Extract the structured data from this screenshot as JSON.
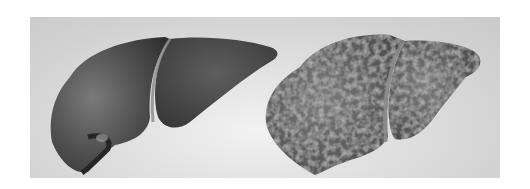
{
  "image": {
    "description": "Grayscale illustration comparing a healthy liver (left, smooth surface) with a cirrhotic liver (right, nodular bumpy surface)",
    "background_color": "#d6d6d6",
    "frame": {
      "x": 30,
      "y": 17,
      "width": 470,
      "height": 161
    },
    "subjects": [
      {
        "name": "healthy-liver",
        "position": "left",
        "surface": "smooth",
        "tone": "#555555"
      },
      {
        "name": "cirrhotic-liver",
        "position": "right",
        "surface": "nodular",
        "tone": "#5e5e5e"
      }
    ]
  }
}
